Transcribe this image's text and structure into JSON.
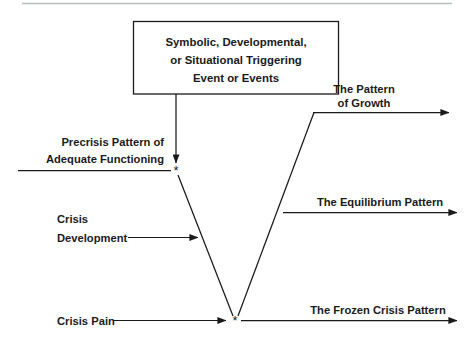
{
  "diagram": {
    "background_color": "#ffffff",
    "line_color": "#1a1a1a",
    "rule_color": "#b9bcc1",
    "trigger_box": {
      "line1": "Symbolic, Developmental,",
      "line2": "or Situational Triggering",
      "line3": "Event or Events"
    },
    "precrisis": {
      "line1": "Precrisis Pattern of",
      "line2": "Adequate Functioning"
    },
    "crisis_development": {
      "line1": "Crisis",
      "line2": "Development"
    },
    "crisis_pain": {
      "label": "Crisis Pain"
    },
    "outcomes": [
      {
        "id": "growth",
        "line1": "The Pattern",
        "line2": "of Growth"
      },
      {
        "id": "equilibrium",
        "line1": "The Equilibrium Pattern",
        "line2": ""
      },
      {
        "id": "frozen",
        "line1": "The Frozen Crisis Pattern",
        "line2": ""
      }
    ],
    "markers": {
      "upper_vertex": "*",
      "lower_vertex": "*"
    }
  }
}
